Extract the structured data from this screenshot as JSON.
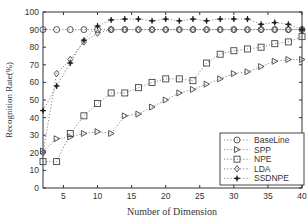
{
  "chart_data": {
    "type": "line",
    "title": "",
    "xlabel": "Number of Dimension",
    "ylabel": "Recognition Rate(%)",
    "xlim": [
      2,
      40
    ],
    "ylim": [
      0,
      100
    ],
    "x_ticks": [
      5,
      10,
      15,
      20,
      25,
      30,
      35,
      40
    ],
    "y_ticks": [
      0,
      10,
      20,
      30,
      40,
      50,
      60,
      70,
      80,
      90,
      100
    ],
    "grid": false,
    "legend_position": "lower right",
    "x": [
      2,
      4,
      6,
      8,
      10,
      12,
      14,
      16,
      18,
      20,
      22,
      24,
      26,
      28,
      30,
      32,
      34,
      36,
      38,
      40
    ],
    "series": [
      {
        "name": "BaseLine",
        "marker": "circle",
        "values": [
          90,
          90,
          90,
          90,
          90,
          90,
          90,
          90,
          90,
          90,
          90,
          90,
          90,
          90,
          90,
          90,
          90,
          90,
          90,
          90
        ]
      },
      {
        "name": "SPP",
        "marker": "triangle-right",
        "values": [
          21,
          28,
          29,
          31,
          32,
          31,
          41,
          42,
          46,
          50,
          54,
          56,
          59,
          62,
          65,
          66,
          69,
          72,
          73,
          73
        ]
      },
      {
        "name": "NPE",
        "marker": "square",
        "values": [
          15,
          15,
          31,
          41,
          48,
          54,
          54,
          57,
          60,
          62,
          62,
          61,
          71,
          76,
          78,
          79,
          80,
          82,
          83,
          86
        ]
      },
      {
        "name": "LDA",
        "marker": "diamond",
        "values": [
          20,
          65,
          73,
          83,
          88,
          90,
          90,
          90,
          90,
          90,
          90,
          90,
          90,
          90,
          90,
          90,
          90,
          90,
          90,
          90
        ]
      },
      {
        "name": "SSDNPE",
        "marker": "star",
        "values": [
          44,
          58,
          71,
          84,
          92,
          95.5,
          96,
          96,
          95,
          96,
          95,
          96,
          95,
          96,
          96,
          96,
          93,
          94,
          93,
          90
        ]
      }
    ]
  }
}
